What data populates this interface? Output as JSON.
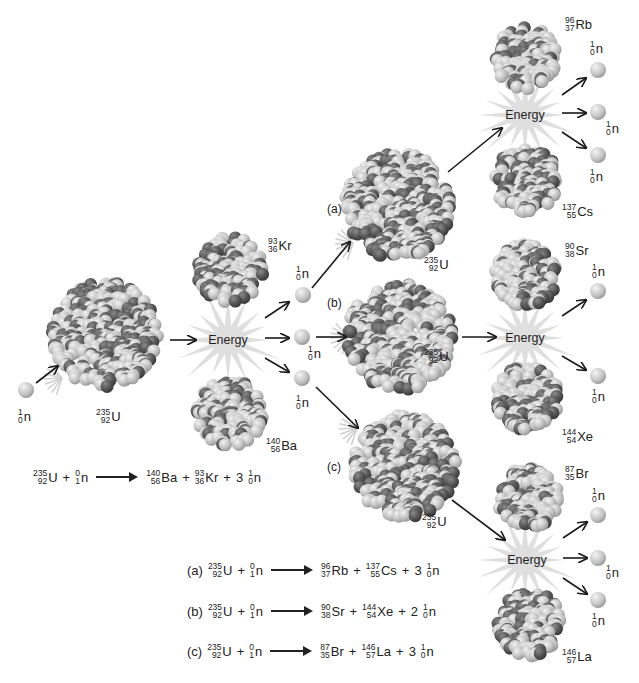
{
  "energy_label": "Energy",
  "neutron": {
    "mass": "1",
    "atomic": "0",
    "symbol": "n"
  },
  "incoming_neutron": {
    "mass": "0",
    "atomic": "1",
    "symbol": "n"
  },
  "uranium": {
    "mass": "235",
    "atomic": "92",
    "symbol": "U"
  },
  "stage1": {
    "products": [
      {
        "mass": "93",
        "atomic": "36",
        "symbol": "Kr"
      },
      {
        "mass": "140",
        "atomic": "56",
        "symbol": "Ba"
      }
    ],
    "neutrons_released": 3
  },
  "branches": [
    {
      "label": "(a)",
      "products": [
        {
          "mass": "96",
          "atomic": "37",
          "symbol": "Rb"
        },
        {
          "mass": "137",
          "atomic": "55",
          "symbol": "Cs"
        }
      ],
      "neutrons": "3"
    },
    {
      "label": "(b)",
      "products": [
        {
          "mass": "90",
          "atomic": "38",
          "symbol": "Sr"
        },
        {
          "mass": "144",
          "atomic": "54",
          "symbol": "Xe"
        }
      ],
      "neutrons": "2"
    },
    {
      "label": "(c)",
      "products": [
        {
          "mass": "87",
          "atomic": "35",
          "symbol": "Br"
        },
        {
          "mass": "146",
          "atomic": "57",
          "symbol": "La"
        }
      ],
      "neutrons": "3"
    }
  ],
  "equations": {
    "main": {
      "product1": {
        "mass": "140",
        "atomic": "56",
        "symbol": "Ba"
      },
      "product2": {
        "mass": "93",
        "atomic": "36",
        "symbol": "Kr"
      },
      "coefficient": "3"
    },
    "plus": "+"
  },
  "colors": {
    "nucleon_light": "#c8c8c8",
    "nucleon_dark": "#5a5a5a",
    "neutron": "#bdbdbd",
    "arrow": "#1a1a1a",
    "burst": "#d6d6d6"
  }
}
